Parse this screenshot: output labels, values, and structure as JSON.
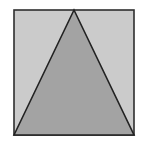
{
  "diagram": {
    "square": {
      "x": 14,
      "y": 10,
      "width": 120,
      "height": 125,
      "fill": "#cbcbcb",
      "stroke": "#2e2e2e"
    },
    "triangle": {
      "points": "14,135 74,10 134,135",
      "fill": "#a3a3a3",
      "stroke": "#222222"
    }
  }
}
